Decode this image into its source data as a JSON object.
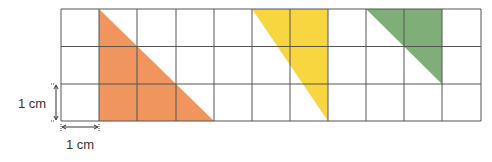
{
  "grid": {
    "columns": 11,
    "rows": 3,
    "cell_unit": "1 cm",
    "line_color": "#555555"
  },
  "shapes": [
    {
      "name": "orange-triangle",
      "color": "#F0955E",
      "vertices_cells": [
        [
          1,
          0
        ],
        [
          1,
          3
        ],
        [
          4,
          3
        ]
      ]
    },
    {
      "name": "yellow-triangle",
      "color": "#F7D640",
      "vertices_cells": [
        [
          5,
          0
        ],
        [
          7,
          0
        ],
        [
          7,
          3
        ]
      ]
    },
    {
      "name": "green-triangle",
      "color": "#7FAE78",
      "vertices_cells": [
        [
          8,
          0
        ],
        [
          10,
          0
        ],
        [
          10,
          2
        ]
      ]
    }
  ],
  "labels": {
    "vertical_scale": "1 cm",
    "horizontal_scale": "1 cm"
  }
}
